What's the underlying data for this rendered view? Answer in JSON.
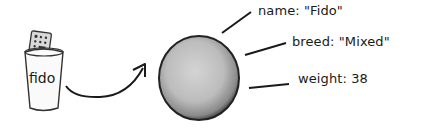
{
  "variable": {
    "name": "fido",
    "container_icon": "cup-with-remote-icon"
  },
  "object": {
    "shape": "sphere",
    "properties": [
      {
        "key": "name",
        "value": "\"Fido\"",
        "display": "name: \"Fido\""
      },
      {
        "key": "breed",
        "value": "\"Mixed\"",
        "display": "breed: \"Mixed\""
      },
      {
        "key": "weight",
        "value": "38",
        "display": "weight:  38"
      }
    ]
  },
  "colors": {
    "ink": "#1a1a1a",
    "sphere_fill": "#b8b8b8",
    "sphere_edge": "#222222"
  }
}
